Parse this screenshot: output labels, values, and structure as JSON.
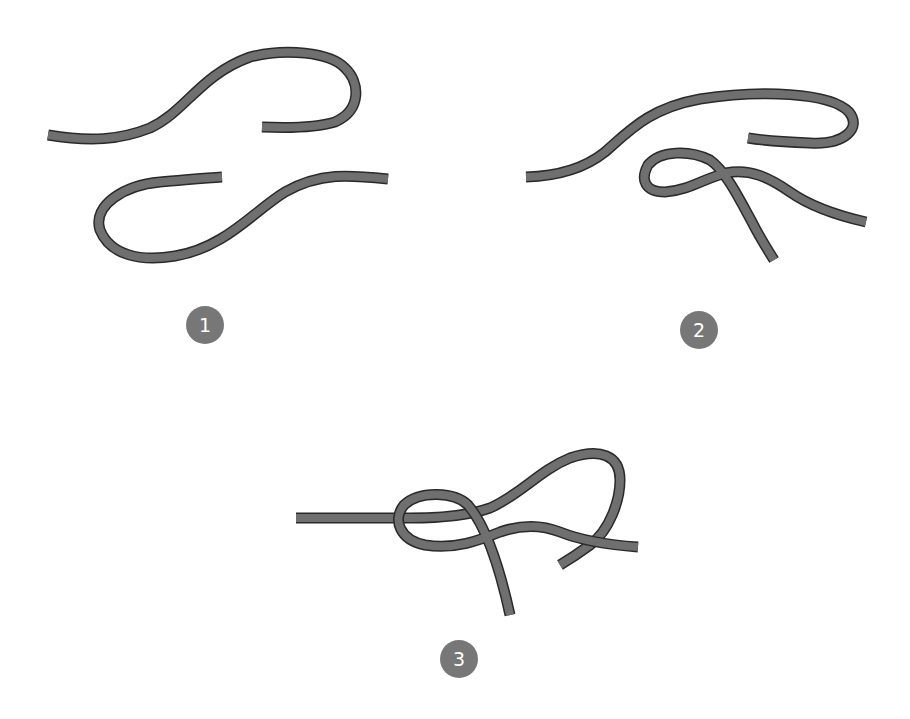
{
  "diagram": {
    "title": "",
    "background": "#ffffff",
    "rope_color": "#6f6f6f",
    "rope_outline_color": "#2a2a2a",
    "badge_color": "#777777",
    "badge_text_color": "#ffffff",
    "steps": [
      {
        "label": "1",
        "badge_center": [
          205,
          325
        ],
        "description": "Two separate rope ends laid out, upper rope curving right and back, lower rope curving left and back",
        "ropes": [
          "M48,135 C90,142 120,140 150,128 C185,112 200,75 250,57 C285,48 330,52 345,68 C360,82 362,110 335,122 C315,128 285,128 262,127",
          "M388,179 C350,175 320,172 285,192 C255,210 225,248 175,256 C140,262 110,255 100,230 C92,205 125,185 160,182 C185,180 205,178 222,177"
        ]
      },
      {
        "label": "2",
        "badge_center": [
          699,
          330
        ],
        "description": "Upper rope crosses over lower rope forming a loop",
        "ropes": [
          "M526,177 C560,176 585,168 605,152 C630,130 650,108 700,99 C760,90 830,92 849,112 C862,128 845,145 810,143 C785,142 760,140 748,138",
          "M866,222 C835,215 810,206 790,192 C770,178 750,168 726,173 C705,178 690,190 665,192 C645,192 640,180 648,165 C660,150 690,150 710,160 C725,170 740,200 752,222 C760,238 768,250 774,260"
        ]
      },
      {
        "label": "3",
        "badge_center": [
          459,
          659
        ],
        "description": "Ends passed through the loop to complete the knot",
        "ropes": [
          "M296,518 C340,518 390,518 410,518 C440,518 470,515 490,508 C520,495 540,470 570,458 C600,448 620,455 620,480 C620,500 610,530 590,545 C575,556 565,562 560,565",
          "M638,547 C610,545 580,540 560,532 C540,524 520,525 500,532 C480,540 455,550 425,545 C400,540 392,520 404,505 C420,490 455,492 468,505 C485,525 498,560 510,615"
        ]
      }
    ]
  }
}
